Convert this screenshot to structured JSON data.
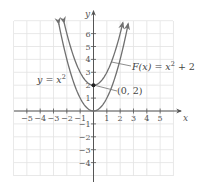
{
  "chart_data": {
    "type": "line",
    "title": "",
    "xlabel": "x",
    "ylabel": "y",
    "xlim": [
      -5.5,
      5.5
    ],
    "ylim": [
      -4.5,
      7
    ],
    "grid": true,
    "x_ticks": [
      -5,
      -4,
      -3,
      -2,
      -1,
      1,
      2,
      3,
      4,
      5
    ],
    "y_ticks": [
      -4,
      -3,
      -2,
      -1,
      1,
      2,
      3,
      4,
      5,
      6
    ],
    "x_tick_labels": [
      "−5",
      "−4",
      "−3",
      "−2",
      "−1",
      "1",
      "2",
      "3",
      "4",
      "5"
    ],
    "y_tick_labels": [
      "−4",
      "−3",
      "−2",
      "−1",
      "1",
      "2",
      "3",
      "4",
      "5",
      "6"
    ],
    "series": [
      {
        "name": "y = x^2",
        "expression": "x^2",
        "x_range": [
          -2.6,
          2.6
        ],
        "shift": 0
      },
      {
        "name": "F(x) = x^2 + 2",
        "expression": "x^2 + 2",
        "x_range": [
          -2.2,
          2.2
        ],
        "shift": 2
      }
    ],
    "points": [
      {
        "x": 0,
        "y": 2,
        "label": "(0, 2)"
      }
    ],
    "annotations": [
      {
        "text": "y = x",
        "sup": "2",
        "target": "y = x^2"
      },
      {
        "text": "F(x) = x",
        "sup": "2",
        "suffix": " + 2",
        "target": "F(x) = x^2 + 2"
      },
      {
        "text": "(0, 2)",
        "target": "point (0, 2)"
      }
    ]
  },
  "labels": {
    "x_axis": "x",
    "y_axis": "y",
    "curve1_main": "y = x",
    "curve1_sup": "2",
    "curve2_main": "F(x) = x",
    "curve2_sup": "2",
    "curve2_suffix": " + 2",
    "point_label": "(0, 2)"
  },
  "colors": {
    "curve": "#707070",
    "axis": "#555555",
    "grid": "#e2e2e2",
    "point": "#222222"
  }
}
